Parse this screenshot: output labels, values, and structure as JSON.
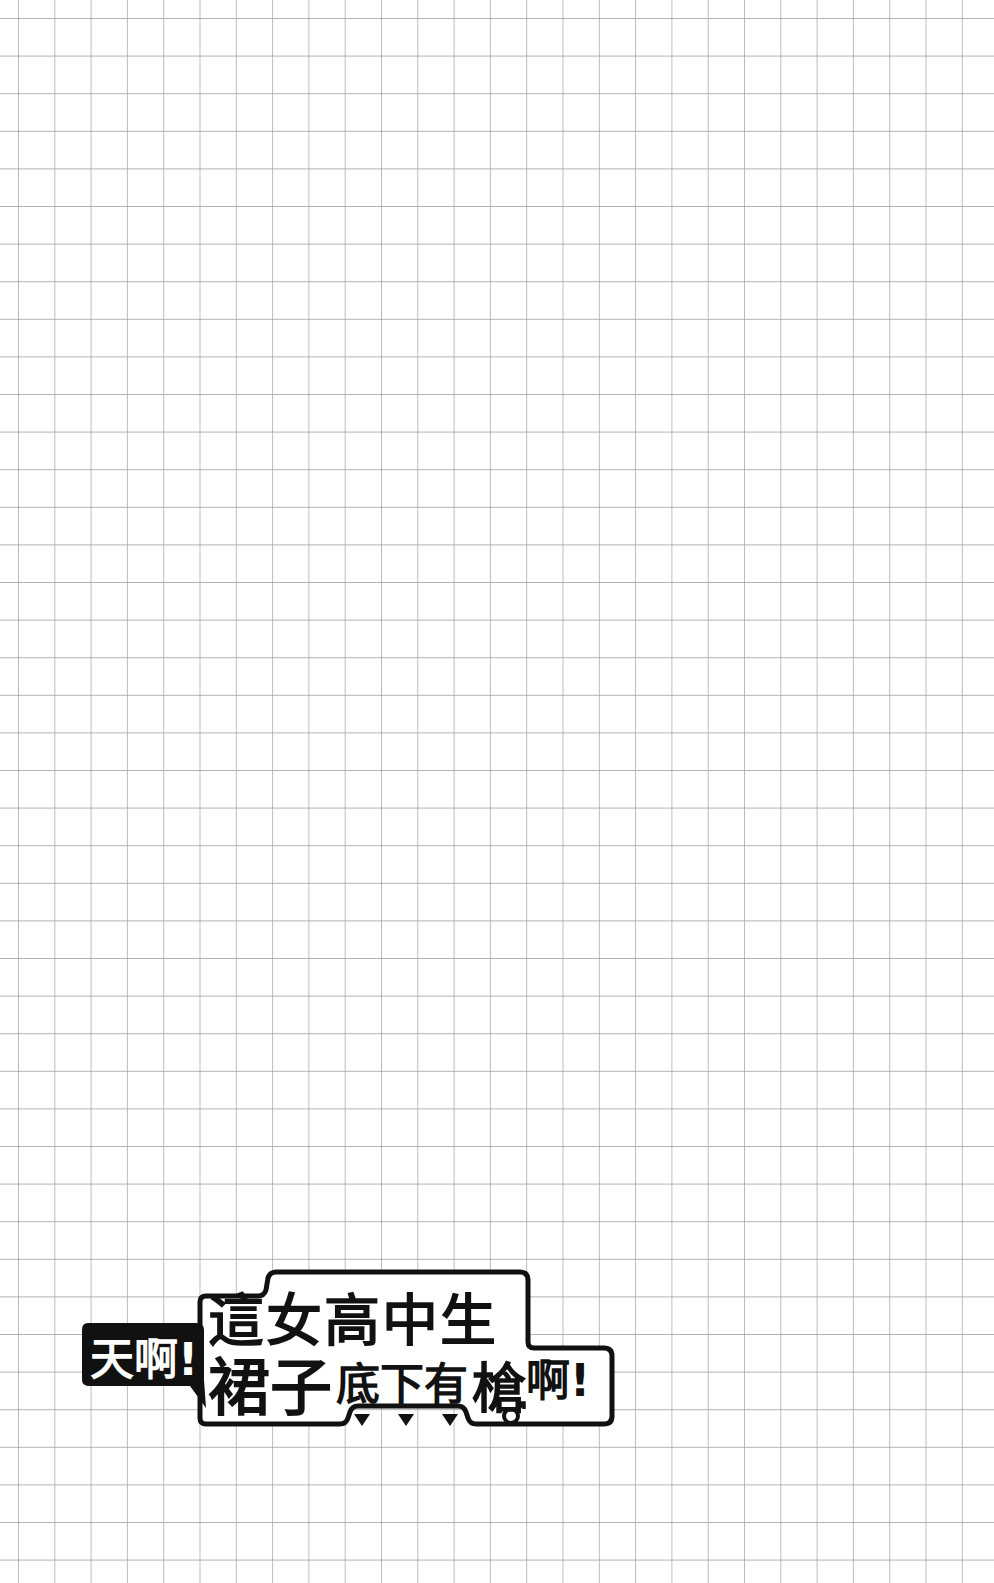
{
  "page": {
    "type": "graph-paper-page",
    "background_color": "#ffffff",
    "grid_line_color": "#9a9a9a"
  },
  "logo": {
    "exclamation_bubble": "天啊!",
    "title_line1": "這女高中生",
    "title_line2_large": "裙子",
    "title_line2_small": "底下有",
    "title_line2_gun": "槍",
    "title_line2_end": "啊!",
    "full_title": "天啊!這女高中生裙子底下有槍啊!",
    "decorations": {
      "question_mark": "?",
      "male_symbol": "♂",
      "down_triangles": [
        "▼",
        "▼",
        "▼"
      ]
    }
  }
}
